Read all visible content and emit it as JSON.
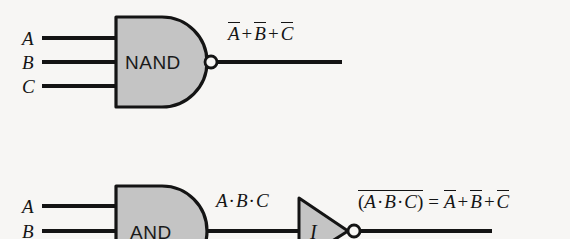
{
  "figure": {
    "background_color": "#f7f6f4",
    "gate_fill_color": "#c4c4c4",
    "line_color": "#141414"
  },
  "diagrams": [
    {
      "id": "nand-diagram",
      "gate_label": "NAND",
      "gate_type": "nand",
      "inputs": [
        {
          "label": "A"
        },
        {
          "label": "B"
        },
        {
          "label": "C"
        }
      ],
      "output_expression": {
        "terms": [
          {
            "text": "A",
            "overbar": true
          },
          {
            "text": "+",
            "overbar": false
          },
          {
            "text": "B",
            "overbar": true
          },
          {
            "text": "+",
            "overbar": false
          },
          {
            "text": "C",
            "overbar": true
          }
        ],
        "plain": "A̅ + B̅ + C̅"
      }
    },
    {
      "id": "and-inverter-diagram",
      "gate_label": "AND",
      "gate_type": "and",
      "inverter_label": "I",
      "inputs": [
        {
          "label": "A"
        },
        {
          "label": "B"
        }
      ],
      "intermediate_expression": {
        "plain": "A · B · C"
      },
      "output_expression": {
        "plain": "(A · B · C)̅ = A̅ + B̅ + C̅"
      }
    }
  ],
  "symbols": {
    "plus": "+",
    "dot": "·",
    "equals": "=",
    "lparen": "(",
    "rparen": ")"
  }
}
